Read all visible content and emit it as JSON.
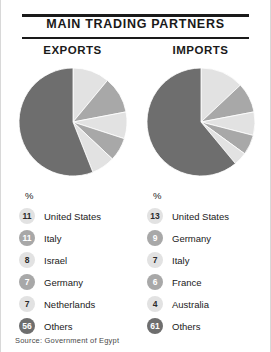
{
  "header": {
    "title": "MAIN TRADING PARTNERS"
  },
  "source": {
    "text": "Source: Government of Egypt"
  },
  "colors": {
    "slice_light": "#e2e2e2",
    "slice_medium": "#a8a8a8",
    "slice_dark": "#6e6e6e",
    "rule": "#1a1a1a",
    "text": "#1a1a1a"
  },
  "panels": [
    {
      "heading": "EXPORTS",
      "unit_label": "%",
      "legend": [
        {
          "value": "11",
          "label": "United States",
          "color": "#e2e2e2",
          "tone": "light"
        },
        {
          "value": "11",
          "label": "Italy",
          "color": "#a8a8a8",
          "tone": "medium"
        },
        {
          "value": "8",
          "label": "Israel",
          "color": "#e2e2e2",
          "tone": "light"
        },
        {
          "value": "7",
          "label": "Germany",
          "color": "#a8a8a8",
          "tone": "medium"
        },
        {
          "value": "7",
          "label": "Netherlands",
          "color": "#e2e2e2",
          "tone": "light"
        },
        {
          "value": "56",
          "label": "Others",
          "color": "#6e6e6e",
          "tone": "dark"
        }
      ]
    },
    {
      "heading": "IMPORTS",
      "unit_label": "%",
      "legend": [
        {
          "value": "13",
          "label": "United States",
          "color": "#e2e2e2",
          "tone": "light"
        },
        {
          "value": "9",
          "label": "Germany",
          "color": "#a8a8a8",
          "tone": "medium"
        },
        {
          "value": "7",
          "label": "Italy",
          "color": "#e2e2e2",
          "tone": "light"
        },
        {
          "value": "6",
          "label": "France",
          "color": "#a8a8a8",
          "tone": "medium"
        },
        {
          "value": "4",
          "label": "Australia",
          "color": "#e2e2e2",
          "tone": "light"
        },
        {
          "value": "61",
          "label": "Others",
          "color": "#6e6e6e",
          "tone": "dark"
        }
      ]
    }
  ],
  "chart_data": [
    {
      "type": "pie",
      "title": "EXPORTS",
      "unit": "%",
      "start_angle_deg": 0,
      "direction": "clockwise",
      "categories": [
        "United States",
        "Italy",
        "Israel",
        "Germany",
        "Netherlands",
        "Others"
      ],
      "values": [
        11,
        11,
        8,
        7,
        7,
        56
      ],
      "colors": [
        "#e2e2e2",
        "#a8a8a8",
        "#e2e2e2",
        "#a8a8a8",
        "#e2e2e2",
        "#6e6e6e"
      ],
      "total": 100,
      "legend_position": "below"
    },
    {
      "type": "pie",
      "title": "IMPORTS",
      "unit": "%",
      "start_angle_deg": 0,
      "direction": "clockwise",
      "categories": [
        "United States",
        "Germany",
        "Italy",
        "France",
        "Australia",
        "Others"
      ],
      "values": [
        13,
        9,
        7,
        6,
        4,
        61
      ],
      "colors": [
        "#e2e2e2",
        "#a8a8a8",
        "#e2e2e2",
        "#a8a8a8",
        "#e2e2e2",
        "#6e6e6e"
      ],
      "total": 100,
      "legend_position": "below"
    }
  ]
}
